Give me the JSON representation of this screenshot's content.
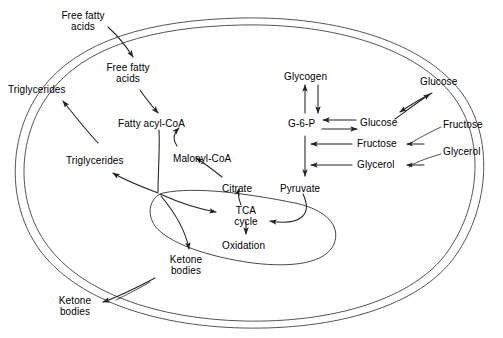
{
  "diagram": {
    "colors": {
      "stroke": "#222222",
      "membrane": "#555555",
      "background": "#ffffff",
      "text": "#000000"
    },
    "membrane_label": "cell-membrane",
    "organelle_label": "mitochondrion"
  },
  "labels": {
    "extracellular": [
      {
        "id": "free-fatty-acids-out",
        "text": "Free fatty\nacids",
        "x": 78,
        "y": 10,
        "align": "center"
      },
      {
        "id": "triglycerides-out",
        "text": "Triglycerides",
        "x": 8,
        "y": 84,
        "align": "left"
      },
      {
        "id": "glucose-out",
        "text": "Glucose",
        "x": 420,
        "y": 76,
        "align": "left"
      },
      {
        "id": "fructose-out",
        "text": "Fructose",
        "x": 443,
        "y": 119,
        "align": "left"
      },
      {
        "id": "glycerol-out",
        "text": "Glycerol",
        "x": 443,
        "y": 146,
        "align": "left"
      },
      {
        "id": "ketone-bodies-out",
        "text": "Ketone\nbodies",
        "x": 74,
        "y": 295,
        "align": "center"
      }
    ],
    "cytosol": [
      {
        "id": "free-fatty-acids-in",
        "text": "Free fatty\nacids",
        "x": 123,
        "y": 72,
        "align": "center"
      },
      {
        "id": "fatty-acyl-coa",
        "text": "Fatty acyl-CoA",
        "x": 124,
        "y": 119,
        "align": "left"
      },
      {
        "id": "triglycerides-in",
        "text": "Triglycerides",
        "x": 72,
        "y": 155,
        "align": "left"
      },
      {
        "id": "malonyl-coa",
        "text": "Malonyl-CoA",
        "x": 175,
        "y": 153,
        "align": "left"
      },
      {
        "id": "citrate",
        "text": "Citrate",
        "x": 222,
        "y": 183,
        "align": "left"
      },
      {
        "id": "ketone-bodies-in",
        "text": "Ketone\nbodies",
        "x": 154,
        "y": 257,
        "align": "center"
      },
      {
        "id": "glycogen",
        "text": "Glycogen",
        "x": 284,
        "y": 71,
        "align": "left"
      },
      {
        "id": "g-6-p",
        "text": "G-6-P",
        "x": 291,
        "y": 118,
        "align": "left"
      },
      {
        "id": "glucose-in",
        "text": "Glucose",
        "x": 360,
        "y": 117,
        "align": "left"
      },
      {
        "id": "fructose-in",
        "text": "Fructose",
        "x": 358,
        "y": 141,
        "align": "left"
      },
      {
        "id": "glycerol-in",
        "text": "Glycerol",
        "x": 358,
        "y": 162,
        "align": "left"
      },
      {
        "id": "pyruvate",
        "text": "Pyruvate",
        "x": 282,
        "y": 183,
        "align": "left"
      }
    ],
    "mitochondrion": [
      {
        "id": "tca-cycle",
        "text": "TCA\ncycle",
        "x": 232,
        "y": 209,
        "align": "center"
      },
      {
        "id": "oxidation",
        "text": "Oxidation",
        "x": 224,
        "y": 240,
        "align": "left"
      }
    ]
  },
  "pathways": [
    {
      "id": "ffa-uptake",
      "from": "free-fatty-acids-out",
      "to": "free-fatty-acids-in",
      "direction": "in"
    },
    {
      "id": "ffa-to-acylcoa",
      "from": "free-fatty-acids-in",
      "to": "fatty-acyl-coa",
      "direction": "forward"
    },
    {
      "id": "acylcoa-to-triglycerides",
      "from": "fatty-acyl-coa",
      "to": "triglycerides-in",
      "direction": "forward"
    },
    {
      "id": "triglycerides-export",
      "from": "triglycerides-in",
      "to": "triglycerides-out",
      "direction": "out"
    },
    {
      "id": "citrate-to-malonylcoa",
      "from": "citrate",
      "to": "malonyl-coa",
      "direction": "forward"
    },
    {
      "id": "malonylcoa-to-acylcoa",
      "from": "malonyl-coa",
      "to": "fatty-acyl-coa",
      "direction": "forward"
    },
    {
      "id": "acylcoa-to-tca",
      "from": "fatty-acyl-coa",
      "to": "tca-cycle",
      "direction": "forward"
    },
    {
      "id": "acylcoa-to-ketones",
      "from": "fatty-acyl-coa",
      "to": "ketone-bodies-in",
      "direction": "forward"
    },
    {
      "id": "ketones-export",
      "from": "ketone-bodies-in",
      "to": "ketone-bodies-out",
      "direction": "out"
    },
    {
      "id": "glycogen-g6p",
      "from": "glycogen",
      "to": "g-6-p",
      "direction": "bidirectional"
    },
    {
      "id": "glucose-g6p",
      "from": "glucose-in",
      "to": "g-6-p",
      "direction": "bidirectional"
    },
    {
      "id": "glucose-transport",
      "from": "glucose-out",
      "to": "glucose-in",
      "direction": "bidirectional"
    },
    {
      "id": "fructose-uptake",
      "from": "fructose-out",
      "to": "fructose-in",
      "direction": "in"
    },
    {
      "id": "fructose-to-g6p",
      "from": "fructose-in",
      "to": "g-6-p",
      "direction": "forward"
    },
    {
      "id": "glycerol-uptake",
      "from": "glycerol-out",
      "to": "glycerol-in",
      "direction": "in"
    },
    {
      "id": "glycerol-to-g6p",
      "from": "glycerol-in",
      "to": "g-6-p",
      "direction": "forward"
    },
    {
      "id": "g6p-to-pyruvate",
      "from": "g-6-p",
      "to": "pyruvate",
      "direction": "forward"
    },
    {
      "id": "pyruvate-to-tca",
      "from": "pyruvate",
      "to": "tca-cycle",
      "direction": "forward"
    },
    {
      "id": "tca-to-oxidation",
      "from": "tca-cycle",
      "to": "oxidation",
      "direction": "forward"
    },
    {
      "id": "tca-to-citrate",
      "from": "tca-cycle",
      "to": "citrate",
      "direction": "forward"
    }
  ]
}
